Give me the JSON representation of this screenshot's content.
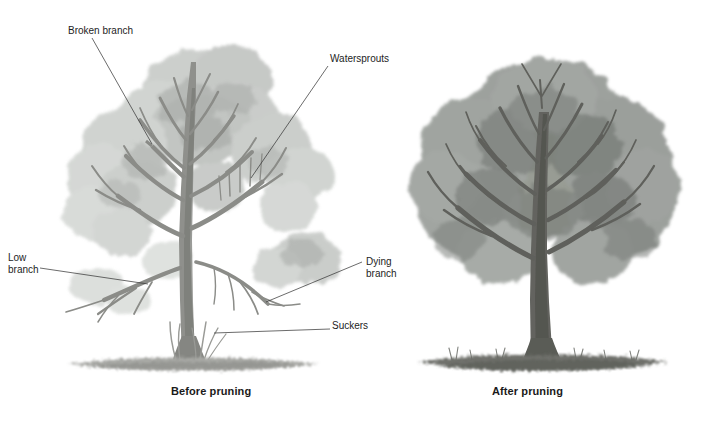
{
  "figure": {
    "background_color": "#ffffff",
    "ink_color": "#1d1d1d"
  },
  "captions": {
    "before": "Before pruning",
    "after": "After pruning"
  },
  "callouts": [
    {
      "key": "broken_branch",
      "label": "Broken branch"
    },
    {
      "key": "watersprouts",
      "label": "Watersprouts"
    },
    {
      "key": "low_branch",
      "label": "Low\nbranch"
    },
    {
      "key": "dying_branch",
      "label": "Dying\nbranch"
    },
    {
      "key": "suckers",
      "label": "Suckers"
    }
  ],
  "panels": {
    "left": {
      "name": "before-pruning-tree",
      "caption": "Before pruning",
      "canopy_tone": "#c4c7c4",
      "trunk_tone": "#8d8d8a",
      "ground_tone": "#a9aaa6"
    },
    "right": {
      "name": "after-pruning-tree",
      "caption": "After pruning",
      "canopy_tone": "#8f938f",
      "trunk_tone": "#5f605d",
      "ground_tone": "#6e706c"
    }
  },
  "colors": {
    "page_rule": "#e2e2e2",
    "leader_line": "#3a3a3a",
    "text": "#1d1d1d"
  }
}
